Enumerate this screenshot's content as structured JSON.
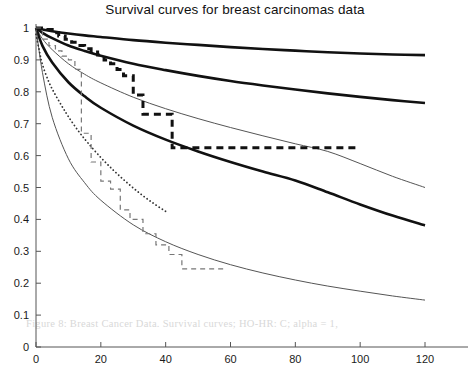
{
  "chart_data": {
    "type": "line",
    "title": "Survival curves for breast carcinomas data",
    "xlabel": "",
    "ylabel": "",
    "xlim": [
      0,
      120
    ],
    "ylim": [
      0,
      1
    ],
    "xticks": [
      0,
      20,
      40,
      60,
      80,
      100,
      120
    ],
    "yticks": [
      0,
      0.1,
      0.2,
      0.3,
      0.4,
      0.5,
      0.6,
      0.7,
      0.8,
      0.9,
      1
    ],
    "grid": false,
    "legend": "none",
    "axis_color": "#555555",
    "series": [
      {
        "name": "model-curve-1",
        "style": "solid-thick",
        "color": "#111111",
        "width": 2.6,
        "x": [
          0,
          2,
          5,
          10,
          15,
          20,
          30,
          40,
          50,
          60,
          70,
          80,
          90,
          100,
          110,
          120
        ],
        "y": [
          1.0,
          0.995,
          0.99,
          0.983,
          0.977,
          0.972,
          0.962,
          0.954,
          0.947,
          0.94,
          0.934,
          0.929,
          0.924,
          0.92,
          0.917,
          0.915
        ]
      },
      {
        "name": "model-curve-2",
        "style": "solid-thick",
        "color": "#111111",
        "width": 2.6,
        "x": [
          0,
          2,
          5,
          10,
          15,
          20,
          30,
          40,
          50,
          60,
          70,
          80,
          90,
          100,
          110,
          120
        ],
        "y": [
          1.0,
          0.985,
          0.968,
          0.945,
          0.928,
          0.913,
          0.888,
          0.868,
          0.85,
          0.834,
          0.82,
          0.807,
          0.795,
          0.784,
          0.774,
          0.765
        ]
      },
      {
        "name": "model-curve-3",
        "style": "solid-thin",
        "color": "#555555",
        "width": 1.0,
        "x": [
          0,
          2,
          5,
          10,
          15,
          20,
          30,
          40,
          50,
          60,
          70,
          80,
          90,
          100,
          110,
          120
        ],
        "y": [
          1.0,
          0.966,
          0.932,
          0.888,
          0.855,
          0.828,
          0.783,
          0.747,
          0.716,
          0.688,
          0.662,
          0.637,
          0.613,
          0.575,
          0.535,
          0.5
        ]
      },
      {
        "name": "model-curve-4",
        "style": "solid-thick",
        "color": "#111111",
        "width": 2.6,
        "x": [
          0,
          2,
          5,
          10,
          15,
          20,
          30,
          40,
          50,
          60,
          70,
          80,
          90,
          100,
          110,
          120
        ],
        "y": [
          1.0,
          0.944,
          0.892,
          0.83,
          0.786,
          0.75,
          0.694,
          0.65,
          0.613,
          0.58,
          0.55,
          0.522,
          0.485,
          0.447,
          0.412,
          0.381
        ]
      },
      {
        "name": "model-curve-5",
        "style": "solid-thin",
        "color": "#555555",
        "width": 1.0,
        "x": [
          0,
          2,
          5,
          10,
          15,
          20,
          30,
          40,
          50,
          60,
          70,
          80,
          90,
          100,
          110,
          120
        ],
        "y": [
          1.0,
          0.86,
          0.72,
          0.59,
          0.515,
          0.46,
          0.383,
          0.33,
          0.29,
          0.258,
          0.232,
          0.21,
          0.191,
          0.175,
          0.16,
          0.147
        ]
      },
      {
        "name": "model-curve-dotted",
        "style": "dotted",
        "color": "#333333",
        "width": 1.8,
        "x": [
          0,
          1,
          2,
          4,
          6,
          8,
          10,
          13,
          16,
          20,
          24,
          28,
          32,
          36,
          40
        ],
        "y": [
          0.98,
          0.93,
          0.885,
          0.83,
          0.79,
          0.755,
          0.722,
          0.678,
          0.64,
          0.594,
          0.553,
          0.516,
          0.482,
          0.452,
          0.425
        ]
      },
      {
        "name": "kaplan-meier-thick-dashed",
        "style": "dashed-thick",
        "color": "#111111",
        "width": 3.0,
        "steps_x": [
          0,
          3,
          5,
          7,
          9,
          11,
          13,
          15,
          17,
          19,
          21,
          23,
          25,
          27,
          30,
          33,
          42,
          100
        ],
        "steps_y": [
          1.0,
          0.995,
          0.985,
          0.975,
          0.965,
          0.955,
          0.945,
          0.935,
          0.925,
          0.915,
          0.9,
          0.888,
          0.87,
          0.85,
          0.79,
          0.73,
          0.625,
          0.625
        ]
      },
      {
        "name": "kaplan-meier-thin-dashed",
        "style": "dashed-thin",
        "color": "#777777",
        "width": 1.2,
        "steps_x": [
          0,
          2,
          4,
          6,
          8,
          10,
          12,
          14,
          17,
          20,
          23,
          26,
          29,
          33,
          37,
          41,
          45,
          58
        ],
        "steps_y": [
          1.0,
          0.965,
          0.945,
          0.928,
          0.912,
          0.9,
          0.87,
          0.67,
          0.58,
          0.52,
          0.495,
          0.43,
          0.4,
          0.355,
          0.32,
          0.29,
          0.245,
          0.245
        ]
      }
    ]
  },
  "bleed_through_text": {
    "line_1": "Figure 8:  Breast Cancer Data. Survival curves; HO-HR: C; alpha = 1,",
    "line_2": "estimates with 95% CI for the model"
  }
}
